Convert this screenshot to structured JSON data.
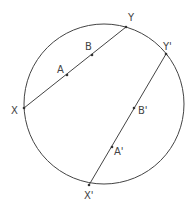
{
  "diagram": {
    "circle": {
      "cx": 104,
      "cy": 104,
      "r": 80,
      "stroke": "#444444"
    },
    "chords": [
      {
        "name": "XY",
        "from": [
          24,
          108
        ],
        "to": [
          126,
          27
        ]
      },
      {
        "name": "X'Y'",
        "from": [
          89,
          185
        ],
        "to": [
          166,
          54
        ]
      }
    ],
    "points": [
      {
        "label": "X",
        "pos": [
          24,
          108
        ],
        "label_pos": [
          11,
          114
        ]
      },
      {
        "label": "Y",
        "pos": [
          126,
          27
        ],
        "label_pos": [
          128,
          21
        ]
      },
      {
        "label": "A",
        "pos": [
          67,
          75
        ],
        "label_pos": [
          57,
          73
        ]
      },
      {
        "label": "B",
        "pos": [
          92,
          55
        ],
        "label_pos": [
          85,
          50
        ]
      },
      {
        "label": "X'",
        "pos": [
          89,
          185
        ],
        "label_pos": [
          84,
          199
        ]
      },
      {
        "label": "Y'",
        "pos": [
          166,
          54
        ],
        "label_pos": [
          163,
          50
        ]
      },
      {
        "label": "A'",
        "pos": [
          112,
          147
        ],
        "label_pos": [
          114,
          155
        ]
      },
      {
        "label": "B'",
        "pos": [
          134,
          108
        ],
        "label_pos": [
          138,
          114
        ]
      }
    ]
  }
}
